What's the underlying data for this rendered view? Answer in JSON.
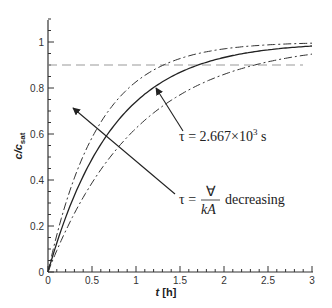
{
  "chart_data": {
    "type": "line",
    "title": "",
    "xlabel": "t [h]",
    "ylabel": "c/c_sat",
    "xlim": [
      0,
      3
    ],
    "ylim": [
      0,
      1.1
    ],
    "xticks": [
      "0",
      "0.5",
      "1",
      "1.5",
      "2",
      "2.5",
      "3"
    ],
    "yticks": [
      "0",
      "0.2",
      "0.4",
      "0.6",
      "0.8",
      "1"
    ],
    "grid": false,
    "series": [
      {
        "name": "tau = 2.667x10^3 s (solid)",
        "style": "solid",
        "tau_h": 0.741,
        "x": [
          0,
          0.5,
          1,
          1.5,
          2,
          2.5,
          3
        ],
        "values": [
          0,
          0.49,
          0.74,
          0.87,
          0.93,
          0.97,
          0.98
        ]
      },
      {
        "name": "smaller tau (dash-dot, upper)",
        "style": "dashdot",
        "tau_h": 0.57,
        "x": [
          0,
          0.5,
          1,
          1.5,
          2,
          2.5,
          3
        ],
        "values": [
          0,
          0.58,
          0.83,
          0.93,
          0.97,
          0.99,
          0.99
        ]
      },
      {
        "name": "larger tau (dash-dot, lower)",
        "style": "dashdot",
        "tau_h": 1.02,
        "x": [
          0,
          0.5,
          1,
          1.5,
          2,
          2.5,
          3
        ],
        "values": [
          0,
          0.39,
          0.62,
          0.77,
          0.86,
          0.91,
          0.95
        ]
      },
      {
        "name": "reference 0.9",
        "style": "dashed",
        "x": [
          0,
          3
        ],
        "values": [
          0.9,
          0.9
        ]
      }
    ],
    "annotations": [
      {
        "text": "τ = 2.667×10³ s",
        "points_to": "solid curve at t≈1.2"
      },
      {
        "text": "τ = ∀/(kA) decreasing",
        "arrow": "towards upper-left"
      }
    ]
  },
  "labels": {
    "xlabel_t": "t",
    "xlabel_unit": " [h]",
    "ylabel_c": "c/c",
    "ylabel_sub": "sat",
    "ann1": "τ = 2.667×10",
    "ann1_exp": "3",
    "ann1_unit": " s",
    "ann2_lhs": "τ =",
    "ann2_num": "∀",
    "ann2_den": "kA",
    "ann2_word": "decreasing"
  }
}
